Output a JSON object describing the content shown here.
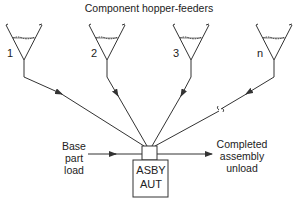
{
  "diagram": {
    "title": "Component hopper-feeders",
    "hoppers": [
      {
        "label": "1"
      },
      {
        "label": "2"
      },
      {
        "label": "3"
      },
      {
        "label": "n"
      }
    ],
    "input": {
      "line1": "Base",
      "line2": "part",
      "line3": "load"
    },
    "output": {
      "line1": "Completed",
      "line2": "assembly",
      "line3": "unload"
    },
    "station": {
      "line1": "ASBY",
      "line2": "AUT"
    },
    "line_color": "#333333"
  }
}
